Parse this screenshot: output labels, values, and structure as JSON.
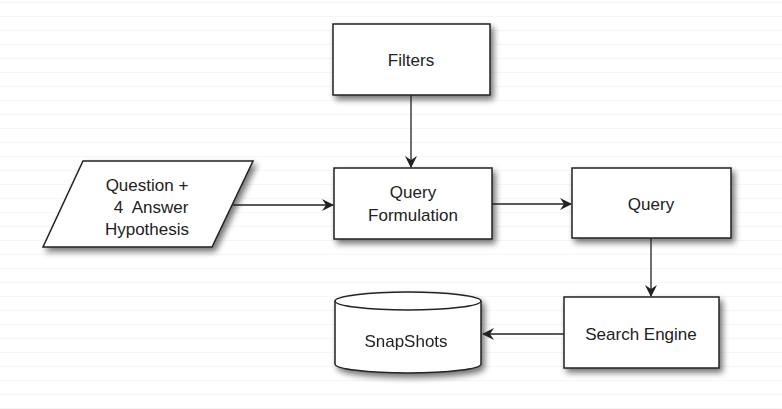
{
  "diagram": {
    "type": "flowchart",
    "nodes": [
      {
        "id": "filters",
        "shape": "rectangle",
        "lines": [
          "Filters"
        ]
      },
      {
        "id": "input",
        "shape": "parallelogram",
        "lines": [
          "Question +",
          "4  Answer",
          "Hypothesis"
        ]
      },
      {
        "id": "query_formulation",
        "shape": "rectangle",
        "lines": [
          "Query",
          "Formulation"
        ]
      },
      {
        "id": "query",
        "shape": "rectangle",
        "lines": [
          "Query"
        ]
      },
      {
        "id": "search_engine",
        "shape": "rectangle",
        "lines": [
          "Search Engine"
        ]
      },
      {
        "id": "snapshots",
        "shape": "cylinder",
        "lines": [
          "SnapShots"
        ]
      }
    ],
    "edges": [
      {
        "from": "filters",
        "to": "query_formulation"
      },
      {
        "from": "input",
        "to": "query_formulation"
      },
      {
        "from": "query_formulation",
        "to": "query"
      },
      {
        "from": "query",
        "to": "search_engine"
      },
      {
        "from": "search_engine",
        "to": "snapshots"
      }
    ],
    "colors": {
      "stroke": "#222222",
      "fill": "#ffffff",
      "shadow": "#9a9a9a",
      "text": "#222222"
    }
  }
}
